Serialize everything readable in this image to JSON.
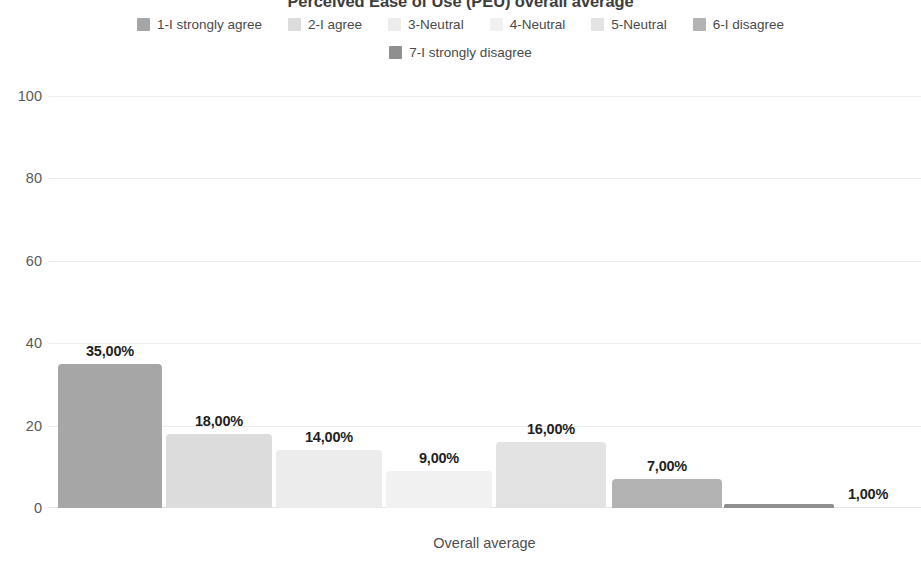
{
  "chart_data": {
    "type": "bar",
    "title": "Perceived Ease of Use (PEU) overall average",
    "xlabel": "Overall average",
    "ylabel": "",
    "categories": [
      "1-I strongly agree",
      "2-I agree",
      "3-Neutral",
      "4-Neutral",
      "5-Neutral",
      "6-I disagree",
      "7-I strongly disagree"
    ],
    "values": [
      35,
      18,
      14,
      9,
      16,
      7,
      1
    ],
    "value_labels": [
      "35,00%",
      "18,00%",
      "14,00%",
      "9,00%",
      "16,00%",
      "7,00%",
      "1,00%"
    ],
    "ylim": [
      0,
      100
    ],
    "yticks": [
      100,
      80,
      60,
      40,
      20,
      0
    ],
    "ytick_labels": [
      "100",
      "80",
      "60",
      "40",
      "20",
      "0"
    ],
    "grid": true,
    "legend_position": "top",
    "x_group": "Overall average",
    "colors": [
      "#a6a6a6",
      "#dcdcdc",
      "#ececec",
      "#f1f1f1",
      "#e3e3e3",
      "#b3b3b3",
      "#8f8f8f"
    ]
  },
  "legend": {
    "row1": [
      {
        "label": "1-I strongly agree",
        "color": "#a6a6a6"
      },
      {
        "label": "2-I agree",
        "color": "#dcdcdc"
      },
      {
        "label": "3-Neutral",
        "color": "#ececec"
      },
      {
        "label": "4-Neutral",
        "color": "#f1f1f1"
      },
      {
        "label": "5-Neutral",
        "color": "#e3e3e3"
      },
      {
        "label": "6-I disagree",
        "color": "#b3b3b3"
      }
    ],
    "row2": [
      {
        "label": "7-I strongly disagree",
        "color": "#8f8f8f"
      }
    ]
  }
}
